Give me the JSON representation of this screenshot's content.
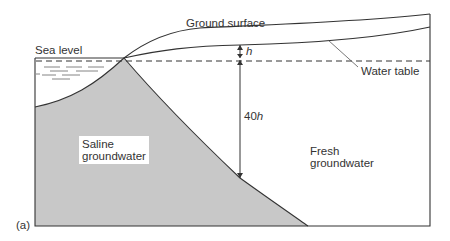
{
  "diagram": {
    "panel_label": "(a)",
    "labels": {
      "ground_surface": "Ground surface",
      "sea_level": "Sea level",
      "water_table": "Water table",
      "h": "h",
      "forty_h_num": "40",
      "forty_h_var": "h",
      "saline_line1": "Saline",
      "saline_line2": "groundwater",
      "fresh_line1": "Fresh",
      "fresh_line2": "groundwater"
    },
    "colors": {
      "line": "#333333",
      "saline_fill": "#c8c8c8",
      "background": "#ffffff"
    }
  }
}
